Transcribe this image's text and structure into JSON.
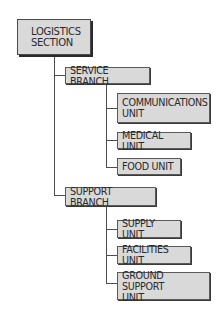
{
  "diagram": {
    "type": "org-chart",
    "root": {
      "label": "LOGISTICS\nSECTION"
    },
    "branches": [
      {
        "label": "SERVICE BRANCH",
        "units": [
          {
            "label": "COMMUNICATIONS\nUNIT"
          },
          {
            "label": "MEDICAL UNIT"
          },
          {
            "label": "FOOD UNIT"
          }
        ]
      },
      {
        "label": "SUPPORT BRANCH",
        "units": [
          {
            "label": "SUPPLY UNIT"
          },
          {
            "label": "FACILITIES UNIT"
          },
          {
            "label": "GROUND SUPPORT\nUNIT"
          }
        ]
      }
    ],
    "colors": {
      "box_fill": "#d9d9d9",
      "box_border": "#5a5a5a",
      "shadow": "#2a2a2a",
      "connector": "#4d4d4d",
      "text": "#2a2a2a"
    }
  }
}
